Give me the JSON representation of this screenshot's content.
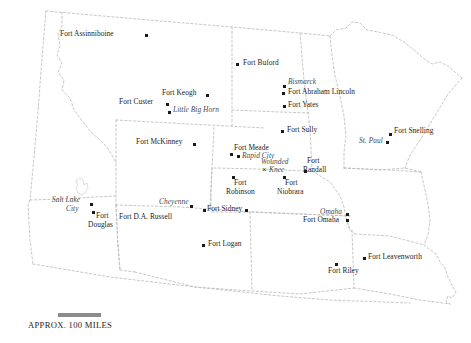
{
  "map": {
    "title": "Western United States Military Forts",
    "scale": {
      "label": "APPROX. 100 MILES",
      "bar_miles": 100
    },
    "colors": {
      "border": "#b9b9b9",
      "point": "#1a1a1a",
      "label": "#1c1c1c",
      "city_label": "#4a4a4a",
      "background": "#ffffff",
      "scalebar": "#8c8c8c"
    },
    "places": [
      {
        "name": "Fort Assinniboine",
        "kind": "fort",
        "x": 145,
        "y": 34,
        "lx": 60,
        "ly": 30,
        "align": "left"
      },
      {
        "name": "Fort Buford",
        "kind": "fort",
        "x": 236,
        "y": 63,
        "lx": 243,
        "ly": 59,
        "align": "left"
      },
      {
        "name": "Bismarck",
        "kind": "city",
        "x": 283,
        "y": 85,
        "lx": 288,
        "ly": 78,
        "align": "left"
      },
      {
        "name": "Fort Abraham Lincoln",
        "kind": "fort",
        "x": 282,
        "y": 92,
        "lx": 288,
        "ly": 88,
        "align": "left"
      },
      {
        "name": "Fort Lincoln",
        "kind": "hidden",
        "x": 0,
        "y": 0,
        "lx": 0,
        "ly": 0,
        "align": "left"
      },
      {
        "name": "Fort Yates",
        "kind": "fort",
        "x": 283,
        "y": 105,
        "lx": 288,
        "ly": 101,
        "align": "left"
      },
      {
        "name": "Fort Keogh",
        "kind": "fort",
        "x": 206,
        "y": 94,
        "lx": 163,
        "ly": 89,
        "align": "left"
      },
      {
        "name": "Fort Custer",
        "kind": "fort",
        "x": 166,
        "y": 103,
        "lx": 120,
        "ly": 98,
        "align": "left"
      },
      {
        "name": "Little Big Horn",
        "kind": "city",
        "x": 168,
        "y": 111,
        "lx": 173,
        "ly": 106,
        "align": "left"
      },
      {
        "name": "Fort McKinney",
        "kind": "fort",
        "x": 193,
        "y": 143,
        "lx": 137,
        "ly": 138,
        "align": "left"
      },
      {
        "name": "Fort Sully",
        "kind": "fort",
        "x": 281,
        "y": 130,
        "lx": 286,
        "ly": 126,
        "align": "left"
      },
      {
        "name": "Fort Snelling",
        "kind": "fort",
        "x": 389,
        "y": 133,
        "lx": 394,
        "ly": 127,
        "align": "left"
      },
      {
        "name": "St. Paul",
        "kind": "city",
        "x": 386,
        "y": 141,
        "lx": 360,
        "ly": 136,
        "align": "left"
      },
      {
        "name": "Fort Meade",
        "kind": "fort",
        "x": 230,
        "y": 153,
        "lx": 234,
        "ly": 144,
        "align": "left"
      },
      {
        "name": "Rapid City",
        "kind": "city",
        "x": 237,
        "y": 155,
        "lx": 241,
        "ly": 151,
        "align": "left"
      },
      {
        "name": "Wounded Knee",
        "kind": "battle",
        "x": 266,
        "y": 170,
        "lx": 263,
        "ly": 159,
        "align": "left"
      },
      {
        "name": "Fort Randall",
        "kind": "fort",
        "x": 304,
        "y": 170,
        "lx": 308,
        "ly": 158,
        "align": "left"
      },
      {
        "name": "Fort Robinson",
        "kind": "fort",
        "x": 232,
        "y": 176,
        "lx": 236,
        "ly": 179,
        "align": "left"
      },
      {
        "name": "Fort Niobrara",
        "kind": "fort",
        "x": 283,
        "y": 176,
        "lx": 288,
        "ly": 179,
        "align": "left"
      },
      {
        "name": "Fort Sidney",
        "kind": "fort",
        "x": 245,
        "y": 209,
        "lx": 208,
        "ly": 205,
        "align": "left"
      },
      {
        "name": "Cheyenne",
        "kind": "city",
        "x": 190,
        "y": 205,
        "lx": 160,
        "ly": 198,
        "align": "left"
      },
      {
        "name": "Fort D.A. Russell",
        "kind": "fort",
        "x": 203,
        "y": 209,
        "lx": 120,
        "ly": 213,
        "align": "left"
      },
      {
        "name": "Salt Lake City",
        "kind": "city",
        "x": 90,
        "y": 203,
        "lx": 53,
        "ly": 197,
        "align": "left"
      },
      {
        "name": "Fort Douglas",
        "kind": "fort",
        "x": 92,
        "y": 211,
        "lx": 95,
        "ly": 212,
        "align": "left"
      },
      {
        "name": "Fort Logan",
        "kind": "fort",
        "x": 202,
        "y": 244,
        "lx": 208,
        "ly": 240,
        "align": "left"
      },
      {
        "name": "Omaha",
        "kind": "city",
        "x": 346,
        "y": 213,
        "lx": 319,
        "ly": 208,
        "align": "left"
      },
      {
        "name": "Fort Omaha",
        "kind": "fort",
        "x": 346,
        "y": 219,
        "lx": 304,
        "ly": 216,
        "align": "left"
      },
      {
        "name": "Fort Leavenworth",
        "kind": "fort",
        "x": 363,
        "y": 257,
        "lx": 368,
        "ly": 253,
        "align": "left"
      },
      {
        "name": "Fort Riley",
        "kind": "fort",
        "x": 335,
        "y": 263,
        "lx": 330,
        "ly": 267,
        "align": "left"
      }
    ],
    "label_lines": {
      "Fort Abraham Lincoln": [
        "Fort Abraham Lincoln"
      ],
      "Wounded Knee": [
        "Wounded",
        "Knee"
      ],
      "Fort Randall": [
        "Fort",
        "Randall"
      ],
      "Fort Robinson": [
        "Fort",
        "Robinson"
      ],
      "Fort Niobrara": [
        "Fort",
        "Niobrara"
      ],
      "Fort Douglas": [
        "Fort",
        "Douglas"
      ],
      "Salt Lake City": [
        "Salt Lake",
        "City"
      ]
    }
  }
}
